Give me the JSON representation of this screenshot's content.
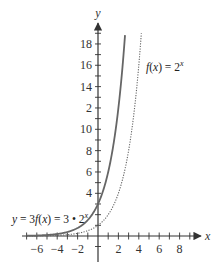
{
  "chart_data": {
    "type": "line",
    "title": "",
    "xlabel": "x",
    "ylabel": "y",
    "xlim": [
      -7,
      10
    ],
    "ylim": [
      0,
      19
    ],
    "grid": false,
    "x_ticks": [
      -6,
      -4,
      -2,
      2,
      4,
      6,
      8
    ],
    "x_tick_labels": [
      "−6",
      "−4",
      "−2",
      "2",
      "4",
      "6",
      "8"
    ],
    "y_ticks": [
      2,
      4,
      6,
      8,
      10,
      12,
      14,
      16,
      18
    ],
    "y_tick_labels": [
      "",
      "4",
      "6",
      "8",
      "10",
      "2",
      "14",
      "16",
      "18"
    ],
    "series": [
      {
        "name": "y = 3f(x) = 3 • 2^x",
        "style": "solid",
        "color": "#666666",
        "function": "3*2^x",
        "x": [
          -7,
          -6,
          -5,
          -4,
          -3,
          -2,
          -1,
          0,
          1,
          2,
          2.66
        ],
        "values": [
          0.023,
          0.047,
          0.094,
          0.1875,
          0.375,
          0.75,
          1.5,
          3,
          6,
          12,
          19
        ]
      },
      {
        "name": "f(x) = 2^x",
        "style": "dotted",
        "color": "#666666",
        "function": "2^x",
        "x": [
          -7,
          -6,
          -5,
          -4,
          -3,
          -2,
          -1,
          0,
          1,
          2,
          3,
          4,
          4.25
        ],
        "values": [
          0.008,
          0.016,
          0.031,
          0.0625,
          0.125,
          0.25,
          0.5,
          1,
          2,
          4,
          8,
          16,
          19
        ]
      }
    ],
    "annotations": [
      {
        "text_main": "f(x) = 2",
        "superscript": "x",
        "near_series": "f(x) = 2^x"
      },
      {
        "text_main": "y = 3f(x) = 3 • 2",
        "superscript": "x",
        "near_series": "y = 3f(x) = 3 • 2^x"
      }
    ]
  }
}
